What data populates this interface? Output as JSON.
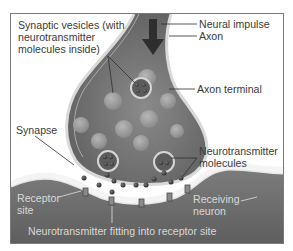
{
  "diagram": {
    "labels": {
      "synaptic_vesicles": [
        "Synaptic vesicles (with",
        "neurotransmitter",
        "molecules inside)"
      ],
      "neural_impulse": "Neural impulse",
      "axon": "Axon",
      "axon_terminal": "Axon terminal",
      "synapse": "Synapse",
      "neurotransmitter_molecules": [
        "Neurotransmitter",
        "molecules"
      ],
      "receptor_site": [
        "Receptor",
        "site"
      ],
      "receiving_neuron": [
        "Receiving",
        "neuron"
      ],
      "fitting": "Neurotransmitter fitting into receptor site"
    },
    "colors": {
      "frame_border": "#7a7a7a",
      "axon_terminal": "#6f6f6f",
      "receiving_neuron": "#727272",
      "synaptic_cleft": "#f4f4f4",
      "vesicle": "#9c9c9c",
      "molecule": "#3c3c3c",
      "arrow": "#2e2e2e",
      "label_dark": "#3a3a3a",
      "label_light": "#d8d8d8"
    }
  }
}
